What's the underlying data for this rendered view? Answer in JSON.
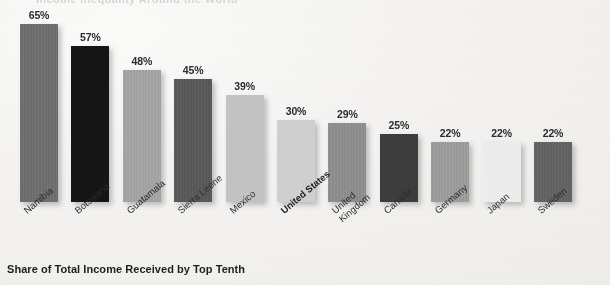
{
  "caption": "Share of Total Income Received by Top Tenth",
  "title_ghost": "Income Inequality Around the World",
  "chart_data": {
    "type": "bar",
    "title": "Share of Total Income Received by Top Tenth",
    "xlabel": "",
    "ylabel": "",
    "ylim": [
      0,
      70
    ],
    "grid": false,
    "legend": "none",
    "categories": [
      "Namibia",
      "Botswana",
      "Guatamala",
      "Sierra Leone",
      "Mexico",
      "United States",
      "United Kingdom",
      "Canada",
      "Germany",
      "Japan",
      "Sweden"
    ],
    "values": [
      65,
      57,
      48,
      45,
      39,
      30,
      29,
      25,
      22,
      22,
      22
    ],
    "value_labels": [
      "65%",
      "57%",
      "48%",
      "45%",
      "39%",
      "30%",
      "29%",
      "25%",
      "22%",
      "22%",
      "22%"
    ],
    "bar_colors": [
      "#6e6e6e",
      "#151515",
      "#a3a3a3",
      "#595959",
      "#c2c2c2",
      "#cfcfcf",
      "#8d8d8d",
      "#3c3c3c",
      "#9b9b9b",
      "#ececec",
      "#636363"
    ],
    "highlighted_category": "United States"
  },
  "bars": [
    {
      "label_line1": "Namibia",
      "label_line2": "",
      "value_label": "65%",
      "value": 65,
      "color": "#6e6e6e",
      "bold": false
    },
    {
      "label_line1": "Botswana",
      "label_line2": "",
      "value_label": "57%",
      "value": 57,
      "color": "#151515",
      "bold": false
    },
    {
      "label_line1": "Guatamala",
      "label_line2": "",
      "value_label": "48%",
      "value": 48,
      "color": "#a3a3a3",
      "bold": false
    },
    {
      "label_line1": "Sierra Leone",
      "label_line2": "",
      "value_label": "45%",
      "value": 45,
      "color": "#595959",
      "bold": false
    },
    {
      "label_line1": "Mexico",
      "label_line2": "",
      "value_label": "39%",
      "value": 39,
      "color": "#c2c2c2",
      "bold": false
    },
    {
      "label_line1": "United States",
      "label_line2": "",
      "value_label": "30%",
      "value": 30,
      "color": "#cfcfcf",
      "bold": true
    },
    {
      "label_line1": "United",
      "label_line2": "Kingdom",
      "value_label": "29%",
      "value": 29,
      "color": "#8d8d8d",
      "bold": false
    },
    {
      "label_line1": "Canada",
      "label_line2": "",
      "value_label": "25%",
      "value": 25,
      "color": "#3c3c3c",
      "bold": false
    },
    {
      "label_line1": "Germany",
      "label_line2": "",
      "value_label": "22%",
      "value": 22,
      "color": "#9b9b9b",
      "bold": false
    },
    {
      "label_line1": "Japan",
      "label_line2": "",
      "value_label": "22%",
      "value": 22,
      "color": "#ececec",
      "bold": false
    },
    {
      "label_line1": "Sweden",
      "label_line2": "",
      "value_label": "22%",
      "value": 22,
      "color": "#636363",
      "bold": false
    }
  ]
}
